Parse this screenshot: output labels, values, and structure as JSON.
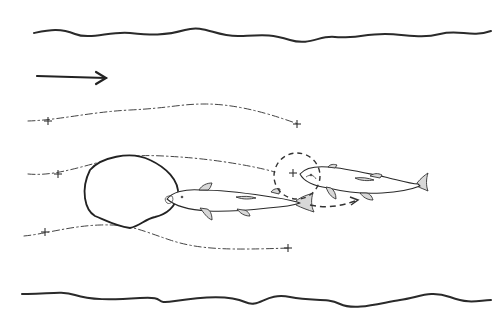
{
  "diagram": {
    "colors": {
      "ink": "#2a2a2a",
      "fin_fill": "#d8d8d8",
      "background": "#ffffff"
    },
    "banks": {
      "top": "M34 33 C 50 30, 60 28, 75 34 S 110 31, 130 33 S 165 36, 185 30 S 215 37, 240 36 S 270 34, 290 40 S 320 35, 335 37 S 365 34, 385 34 S 420 39, 440 34 S 470 38, 491 31",
      "bottom": "M22 294 C 45 295, 60 290, 75 295 S 110 300, 140 298 S 150 305, 175 301 S 230 295, 245 302 S 265 292, 290 297 S 325 297, 340 304 S 380 303, 400 300 S 430 290, 450 297 S 475 301, 491 300"
    },
    "flow_direction": {
      "icon": "arrow-right-icon",
      "x1": 37,
      "y1": 76,
      "x2": 106,
      "y2": 78
    },
    "streamlines": [
      {
        "d": "M28 121 C 60 120, 90 112, 130 110 S 180 104, 205 104 S 260 110, 298 124",
        "markers": [
          [
            48,
            121
          ],
          [
            297,
            124
          ]
        ]
      },
      {
        "d": "M28 174 C 50 176, 70 170, 100 162 S 150 155, 180 157 S 250 165, 275 172",
        "markers": [
          [
            58,
            174
          ],
          [
            293,
            173
          ]
        ]
      },
      {
        "d": "M24 236 C 45 234, 70 226, 100 225 S 140 230, 170 240 S 230 250, 290 248",
        "markers": [
          [
            45,
            232
          ],
          [
            288,
            248
          ]
        ]
      }
    ],
    "wake_region": "M90 170 C 100 158, 130 150, 150 160 C 165 167, 180 180, 178 196 C 175 206, 168 214, 155 217 C 145 219, 140 226, 130 228 C 115 226, 105 220, 95 216 C 85 210, 80 190, 90 170 Z",
    "vortex_ring": {
      "cx": 297,
      "cy": 176,
      "r": 23
    },
    "reposition_path": {
      "d": "M310 205 C 325 208, 338 207, 355 201",
      "arrowhead": "M350 197 L 358 200 L 351 205"
    },
    "fish": [
      {
        "name": "lead-fish",
        "body": "M167 199 C 172 192, 185 189, 200 190 C 220 190, 245 193, 265 196 C 280 198, 290 200, 297 202 L 300 203 C 292 206, 282 207, 268 208 C 250 210, 228 212, 208 211 C 190 210, 176 207, 167 199 Z",
        "tail": "M296 201 C 302 196, 308 195, 313 193 C 311 199, 311 206, 314 212 C 308 210, 302 208, 296 205 Z",
        "fins": [
          "M199 190 C 202 185, 207 183, 212 183 C 211 186, 210 189, 208 190 Z",
          "M200 208 C 204 213, 207 218, 212 220 C 212 214, 210 210, 207 209 Z",
          "M237 209 C 240 213, 244 216, 250 216 C 249 212, 246 210, 243 210 Z",
          "M271 192 C 273 189, 277 188, 280 189 L 279 194 Z",
          "M236 197 C 244 196, 250 196, 256 198 C 250 199, 244 200, 236 197 Z"
        ],
        "head_detail": "M172 196 C 166 195, 163 199, 167 203 C 170 205, 175 201, 172 196 Z",
        "eye": [
          182,
          197
        ]
      },
      {
        "name": "trailing-fish",
        "body": "M300 174 C 305 168, 315 166, 328 167 C 345 168, 365 173, 385 177 C 398 180, 410 184, 418 184 L 420 186 C 410 190, 398 192, 382 193 C 365 194, 345 192, 328 188 C 314 186, 304 182, 300 174 Z",
        "tail": "M417 183 C 421 178, 425 175, 428 173 C 426 179, 426 186, 428 191 C 424 189, 420 188, 417 186 Z",
        "fins": [
          "M326 187 C 328 193, 331 197, 336 199 C 336 194, 334 190, 331 188 Z",
          "M360 193 C 363 197, 367 200, 373 200 C 372 196, 369 193, 366 193 Z",
          "M328 167 C 330 164, 334 164, 337 165 L 335 168 Z",
          "M370 176 C 374 173, 378 173, 382 175 L 380 178 Z",
          "M355 178 C 362 177, 368 178, 374 180 C 368 181, 361 181, 355 178 Z"
        ],
        "head_detail": "M306 177 C 310 174, 314 175, 316 179",
        "eye": [
          311,
          175
        ]
      }
    ]
  }
}
